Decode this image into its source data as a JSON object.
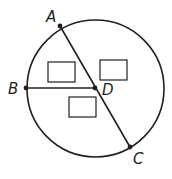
{
  "diagram": {
    "type": "circle-geometry",
    "stroke_color": "#231f20",
    "circle": {
      "cx": 95.5,
      "cy": 88.5,
      "r": 68.5
    },
    "points": [
      {
        "id": "A",
        "label": "A",
        "x": 60,
        "y": 26,
        "label_x": 46,
        "label_y": 22
      },
      {
        "id": "B",
        "label": "B",
        "x": 26,
        "y": 88,
        "label_x": 8,
        "label_y": 94
      },
      {
        "id": "C",
        "label": "C",
        "x": 130,
        "y": 147,
        "label_x": 133,
        "label_y": 164
      },
      {
        "id": "D",
        "label": "D",
        "x": 95,
        "y": 88,
        "label_x": 102,
        "label_y": 95
      }
    ],
    "segments": [
      {
        "from": "A",
        "to": "C"
      },
      {
        "from": "B",
        "to": "D"
      }
    ],
    "answer_boxes": [
      {
        "id": "box-1",
        "x": 48,
        "y": 62,
        "w": 27,
        "h": 20,
        "value": ""
      },
      {
        "id": "box-2",
        "x": 100,
        "y": 60,
        "w": 27,
        "h": 20,
        "value": ""
      },
      {
        "id": "box-3",
        "x": 69,
        "y": 97,
        "w": 27,
        "h": 20,
        "value": ""
      }
    ]
  }
}
